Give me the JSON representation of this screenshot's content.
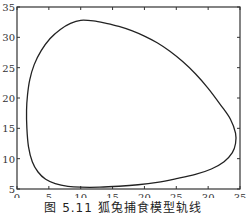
{
  "chart_data": {
    "type": "line",
    "title": "",
    "caption": "图 5.11   狐兔捕食模型轨线",
    "xlabel": "",
    "ylabel": "",
    "xlim": [
      0,
      35
    ],
    "ylim": [
      5,
      35
    ],
    "xticks": [
      0,
      5,
      10,
      15,
      20,
      25,
      30,
      35
    ],
    "yticks": [
      5,
      10,
      15,
      20,
      25,
      30,
      35
    ],
    "grid": false,
    "legend": null,
    "series": [
      {
        "name": "orbit",
        "closed": true,
        "color": "#222222",
        "points": [
          [
            10,
            32.8
          ],
          [
            12,
            32.7
          ],
          [
            14,
            32.3
          ],
          [
            16,
            31.8
          ],
          [
            18,
            31.1
          ],
          [
            20,
            30.2
          ],
          [
            22,
            29.1
          ],
          [
            24,
            27.7
          ],
          [
            26,
            26.0
          ],
          [
            28,
            24.0
          ],
          [
            30,
            21.6
          ],
          [
            32,
            18.8
          ],
          [
            33.5,
            16.5
          ],
          [
            34.3,
            14.2
          ],
          [
            34.3,
            12.5
          ],
          [
            33.8,
            11.0
          ],
          [
            32.5,
            9.5
          ],
          [
            30.5,
            8.3
          ],
          [
            28,
            7.4
          ],
          [
            25,
            6.7
          ],
          [
            22,
            6.1
          ],
          [
            19,
            5.7
          ],
          [
            16,
            5.45
          ],
          [
            13,
            5.3
          ],
          [
            10,
            5.3
          ],
          [
            8,
            5.45
          ],
          [
            6,
            5.9
          ],
          [
            4.5,
            6.6
          ],
          [
            3.3,
            7.8
          ],
          [
            2.4,
            9.5
          ],
          [
            1.8,
            12
          ],
          [
            1.55,
            15
          ],
          [
            1.5,
            18
          ],
          [
            1.65,
            20.5
          ],
          [
            2.0,
            23
          ],
          [
            2.7,
            25.5
          ],
          [
            3.8,
            27.8
          ],
          [
            5.2,
            29.8
          ],
          [
            6.8,
            31.3
          ],
          [
            8.4,
            32.3
          ],
          [
            10,
            32.8
          ]
        ]
      }
    ]
  },
  "caption": "图 5.11   狐兔捕食模型轨线",
  "axes": {
    "x_tick_labels": [
      "0",
      "5",
      "10",
      "15",
      "20",
      "25",
      "30",
      "35"
    ],
    "y_tick_labels": [
      "5",
      "10",
      "15",
      "20",
      "25",
      "30",
      "35"
    ]
  }
}
